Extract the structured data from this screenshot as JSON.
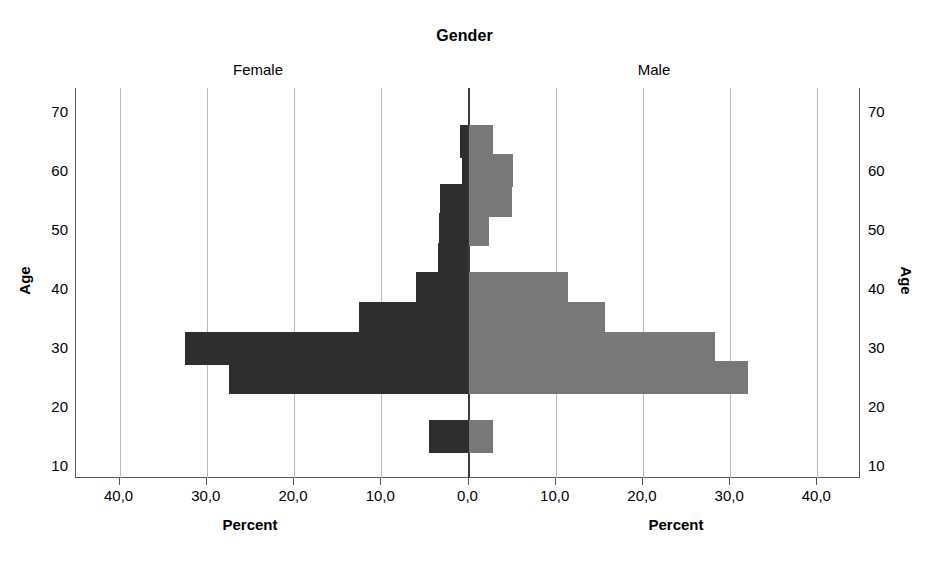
{
  "chart_data": {
    "type": "bar",
    "subtype": "population-pyramid",
    "title": "Gender",
    "xlabel": "Percent",
    "ylabel": "Age",
    "panels": [
      {
        "name": "Female",
        "side": "left",
        "color": "#2e2e2e"
      },
      {
        "name": "Male",
        "side": "right",
        "color": "#787878"
      }
    ],
    "categories": [
      65,
      60,
      55,
      50,
      45,
      40,
      35,
      30,
      25,
      15
    ],
    "series": [
      {
        "name": "Female",
        "values": [
          1.0,
          0.7,
          3.3,
          3.4,
          3.5,
          6.0,
          12.6,
          32.5,
          27.5,
          4.5
        ]
      },
      {
        "name": "Male",
        "values": [
          2.8,
          5.1,
          5.0,
          2.3,
          0.0,
          11.4,
          15.6,
          28.3,
          32.0,
          2.8
        ]
      }
    ],
    "xlim": [
      -45,
      45
    ],
    "xticks": [
      -40,
      -30,
      -20,
      -10,
      0,
      10,
      20,
      30,
      40
    ],
    "xtick_labels": [
      "40,0",
      "30,0",
      "20,0",
      "10,0",
      "0,0",
      "10,0",
      "20,0",
      "30,0",
      "40,0"
    ],
    "ylim": [
      8,
      74
    ],
    "yticks": [
      70,
      60,
      50,
      40,
      30,
      20,
      10
    ],
    "ytick_labels": [
      "70",
      "60",
      "50",
      "40",
      "30",
      "20",
      "10"
    ],
    "grid": true,
    "grid_axis": "x",
    "legend": "none",
    "bar_gap": 0
  },
  "axes": {
    "title": "Gender",
    "left_panel_label": "Female",
    "right_panel_label": "Male",
    "y_axis_title_left": "Age",
    "y_axis_title_right": "Age",
    "x_axis_title_left": "Percent",
    "x_axis_title_right": "Percent"
  },
  "colors": {
    "female_bar": "#2e2e2e",
    "male_bar": "#787878",
    "gridline": "#b9b9b9",
    "axis": "#555555",
    "center_axis": "#3a3a3a",
    "background": "#ffffff",
    "text": "#000000"
  }
}
